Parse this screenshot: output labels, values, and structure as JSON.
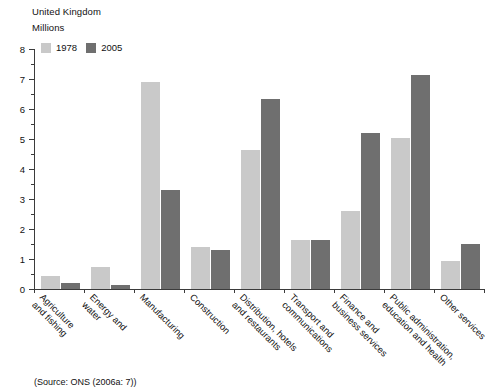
{
  "header": {
    "region": "United Kingdom",
    "units": "Millions"
  },
  "legend": {
    "items": [
      {
        "label": "1978",
        "color": "#c9c9c9"
      },
      {
        "label": "2005",
        "color": "#6f6f6f"
      }
    ]
  },
  "source": {
    "text": "(Source: ONS (2006a: 7))"
  },
  "chart_data": {
    "type": "bar",
    "title": "United Kingdom",
    "subtitle": "Millions",
    "xlabel": "",
    "ylabel": "Millions",
    "ylim": [
      0,
      8
    ],
    "ytick_step": 1,
    "yminor_step": 0.5,
    "grid": false,
    "legend_position": "top-left",
    "ytick_labels": [
      "0",
      "1",
      "2",
      "3",
      "4",
      "5",
      "6",
      "7",
      "8"
    ],
    "categories": [
      "Agriculture and fishing",
      "Energy and water",
      "Manufacturing",
      "Construction",
      "Distribution, hotels and restaurants",
      "Transport and communications",
      "Finance and business services",
      "Public administration, education and health",
      "Other services"
    ],
    "category_lines": [
      [
        "Agriculture",
        "and fishing"
      ],
      [
        "Energy and",
        "water"
      ],
      [
        "Manufacturing",
        ""
      ],
      [
        "Construction",
        ""
      ],
      [
        "Distribution, hotels",
        "and restaurants"
      ],
      [
        "Transport and",
        "communications"
      ],
      [
        "Finance and",
        "business services"
      ],
      [
        "Public administration,",
        "education and health"
      ],
      [
        "Other services",
        ""
      ]
    ],
    "series": [
      {
        "name": "1978",
        "color": "#c9c9c9",
        "values": [
          0.45,
          0.75,
          6.9,
          1.4,
          4.65,
          1.65,
          2.6,
          5.05,
          0.95
        ]
      },
      {
        "name": "2005",
        "color": "#6f6f6f",
        "values": [
          0.2,
          0.15,
          3.3,
          1.3,
          6.35,
          1.65,
          5.2,
          7.15,
          1.5
        ]
      }
    ]
  }
}
